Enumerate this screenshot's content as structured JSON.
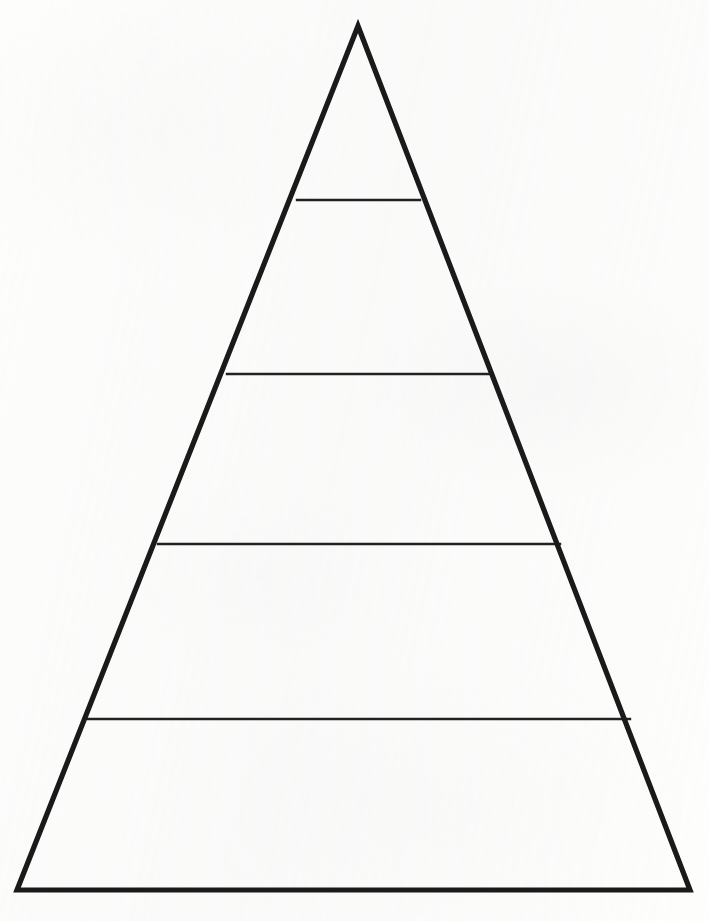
{
  "document": {
    "title": "Blank Pyramid Diagram",
    "kind": "pyramid-worksheet-template",
    "width": 709,
    "height": 921
  },
  "canvas": {
    "background_color": "#fdfdfc",
    "paper_tint": "#f7f7f6"
  },
  "style": {
    "outline_color": "#1a1a1a",
    "outline_width": 5.2,
    "divider_color": "#222222",
    "divider_width": 2.4,
    "fill_color": "#ffffff"
  },
  "chart_data": {
    "type": "pie",
    "title": "",
    "subtitle": "",
    "xlabel": "",
    "ylabel": "",
    "legend_position": "none",
    "grid": false,
    "shape": "pyramid",
    "tier_count": 5,
    "categories": [
      "Tier 1",
      "Tier 2",
      "Tier 3",
      "Tier 4",
      "Tier 5"
    ],
    "values": [
      1,
      1,
      1,
      1,
      1
    ],
    "labels_visible": false,
    "geometry": {
      "apex": [
        358,
        26
      ],
      "base_left": [
        17,
        890
      ],
      "base_right": [
        690,
        890
      ],
      "divider_y": [
        200,
        374,
        544,
        719
      ],
      "divider_spans": [
        [
          297,
          420
        ],
        [
          227,
          490
        ],
        [
          158,
          560
        ],
        [
          88,
          630
        ]
      ]
    },
    "tiers": [
      {
        "index": 1,
        "label": "",
        "top_y": 26,
        "bottom_y": 200,
        "top_width": 0,
        "bottom_width": 123
      },
      {
        "index": 2,
        "label": "",
        "top_y": 200,
        "bottom_y": 374,
        "top_width": 123,
        "bottom_width": 263
      },
      {
        "index": 3,
        "label": "",
        "top_y": 374,
        "bottom_y": 544,
        "top_width": 263,
        "bottom_width": 402
      },
      {
        "index": 4,
        "label": "",
        "top_y": 544,
        "bottom_y": 719,
        "top_width": 402,
        "bottom_width": 542
      },
      {
        "index": 5,
        "label": "",
        "top_y": 719,
        "bottom_y": 890,
        "top_width": 542,
        "bottom_width": 673
      }
    ]
  }
}
